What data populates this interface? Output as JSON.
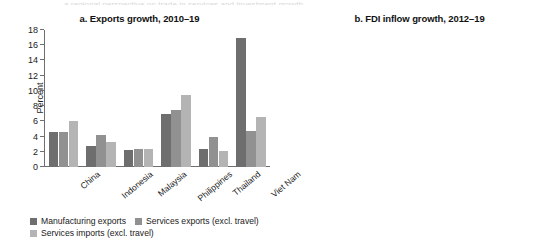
{
  "caption_sliver": "a regional perspective on trade in services and investment growth",
  "panels": [
    {
      "id": "panel-a",
      "title": "a. Exports growth, 2010–19",
      "ylabel": "Percent"
    },
    {
      "id": "panel-b",
      "title": "b. FDI inflow growth, 2012–19",
      "ylabel": "Percent"
    }
  ],
  "colors": {
    "dark_gray": "#6e6e6e",
    "mid_gray": "#919191",
    "light_gray": "#b4b4b4",
    "axis": "#6f6f6f",
    "text": "#1a1a1a"
  },
  "chart_data": [
    {
      "type": "bar",
      "title": "a. Exports growth, 2010–19",
      "xlabel": "",
      "ylabel": "Percent",
      "ylim": [
        0,
        18
      ],
      "yticks": [
        0,
        2,
        4,
        6,
        8,
        10,
        12,
        14,
        16,
        18
      ],
      "ytick_labels": [
        "0",
        "2",
        "4",
        "6",
        "8",
        "10",
        "12",
        "14",
        "16",
        "18"
      ],
      "grid": false,
      "legend_position": "bottom-left",
      "categories": [
        "China",
        "Indonesia",
        "Malaysia",
        "Philippines",
        "Thailand",
        "Viet Nam"
      ],
      "series": [
        {
          "name": "Manufacturing exports",
          "color": "#6e6e6e",
          "values": [
            4.6,
            2.8,
            2.2,
            7.0,
            2.4,
            17.0
          ]
        },
        {
          "name": "Services exports (excl. travel)",
          "color": "#919191",
          "values": [
            4.6,
            4.2,
            2.4,
            7.5,
            4.0,
            4.7
          ]
        },
        {
          "name": "Services imports (excl. travel)",
          "color": "#b4b4b4",
          "values": [
            6.1,
            3.3,
            2.4,
            9.4,
            2.1,
            6.6
          ]
        }
      ]
    },
    {
      "type": "bar",
      "title": "b. FDI inflow growth, 2012–19",
      "xlabel": "",
      "ylabel": "Percent",
      "ylim": [
        -10,
        30
      ],
      "yticks": [
        -10,
        -5,
        0,
        5,
        10,
        15,
        20,
        25,
        30
      ],
      "ytick_labels": [
        "–10",
        "–5",
        "0",
        "5",
        "10",
        "15",
        "20",
        "25",
        "30"
      ],
      "grid": false,
      "zero_line": true,
      "legend_position": "bottom-right",
      "categories": [
        "China",
        "Indonesia",
        "Malaysia",
        "Philippines",
        "Thailand",
        "Viet Nam"
      ],
      "series": [
        {
          "name": "Manufacturing",
          "color": "#6e6e6e",
          "values": [
            -4.3,
            -0.5,
            3.3,
            4.0,
            0.7,
            6.8
          ]
        },
        {
          "name": "Services",
          "color": "#919191",
          "values": [
            7.1,
            11.4,
            7.5,
            25.5,
            3.0,
            27.1
          ]
        }
      ]
    }
  ]
}
